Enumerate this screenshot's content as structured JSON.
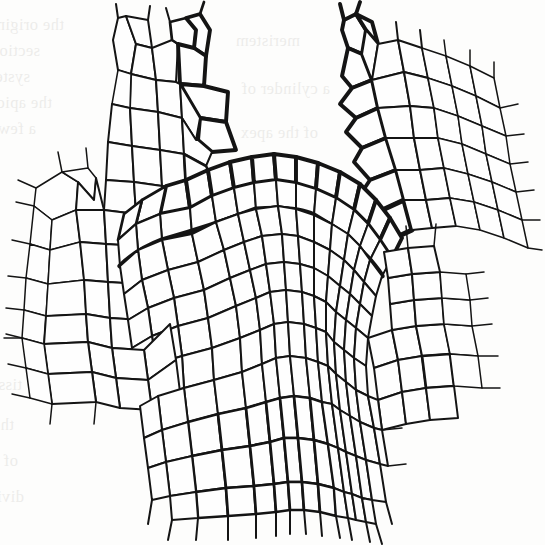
{
  "figure": {
    "kind": "botanical-line-drawing",
    "medium": "ink line drawing, monochrome halftone scan",
    "background_color": "#fdfdfc",
    "line_color": "#141414",
    "canvas": {
      "width": 545,
      "height": 545
    }
  },
  "structures": {
    "apical_dome": {
      "label": "apical dome",
      "description": "central rounded meristematic dome with layered tunica and corpus",
      "apex_x": 272,
      "apex_y": 152
    },
    "tunica": {
      "label": "tunica",
      "layers": 2,
      "description": "outer anticlinally dividing cell layers forming the dome surface"
    },
    "corpus": {
      "label": "corpus",
      "description": "inner mass of isodiametric meristematic cells beneath the tunica"
    },
    "left_primordium": {
      "label": "leaf primordium (left)",
      "description": "young leaf primordium rising on the left flank of the apex"
    },
    "right_primordium": {
      "label": "leaf primordium (right)",
      "description": "young leaf primordium rising on the right flank of the apex"
    },
    "pith": {
      "label": "pith / rib meristem",
      "description": "enlarged vacuolated cells in transverse files below the dome"
    },
    "procambium": {
      "label": "procambial strands",
      "description": "elongate narrow cell files running down the flanks"
    }
  },
  "ghost_text": {
    "note": "faint show-through of printed text from the reverse side of the page; illegible",
    "lines": [
      {
        "text": "the original length of the cell",
        "x": 64,
        "y": 12,
        "mirrored": true
      },
      {
        "text": "sections are cut so that",
        "x": 40,
        "y": 38,
        "mirrored": true
      },
      {
        "text": "system of the stem",
        "x": 30,
        "y": 64,
        "mirrored": true
      },
      {
        "text": "the apical region",
        "x": 52,
        "y": 90,
        "mirrored": true
      },
      {
        "text": "a few of which",
        "x": 36,
        "y": 116,
        "mirrored": true
      },
      {
        "text": "tissue",
        "x": 22,
        "y": 372,
        "mirrored": true
      },
      {
        "text": "the cells",
        "x": 14,
        "y": 412,
        "mirrored": true
      },
      {
        "text": "of which",
        "x": 18,
        "y": 448,
        "mirrored": true
      },
      {
        "text": "divide",
        "x": 24,
        "y": 484,
        "mirrored": true
      },
      {
        "text": "meristem",
        "x": 300,
        "y": 28,
        "mirrored": true
      },
      {
        "text": "a cylinder of",
        "x": 330,
        "y": 76,
        "mirrored": true
      },
      {
        "text": "of the apex",
        "x": 318,
        "y": 120,
        "mirrored": true
      },
      {
        "text": "zone",
        "x": 400,
        "y": 166,
        "mirrored": true
      },
      {
        "text": "cells",
        "x": 470,
        "y": 196,
        "mirrored": true
      }
    ]
  }
}
